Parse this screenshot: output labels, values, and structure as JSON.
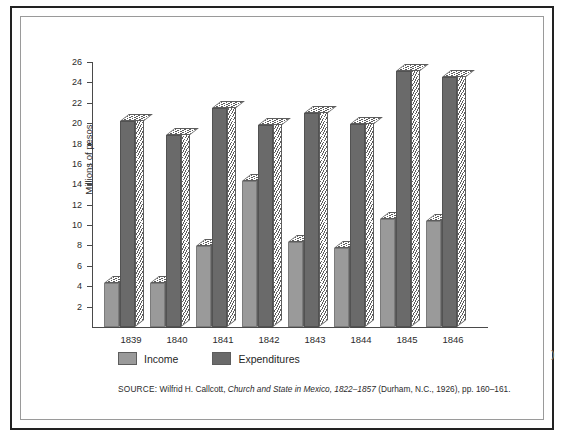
{
  "figure": {
    "y_axis_title": "Millions of pesos",
    "page_artifact": ")"
  },
  "legend": {
    "items": [
      {
        "label": "Income",
        "color": "#9a9a9a"
      },
      {
        "label": "Expenditures",
        "color": "#6a6a6a"
      }
    ]
  },
  "source": {
    "label": "SOURCE:",
    "author": "Wilfrid H. Callcott,",
    "title": "Church and State in Mexico, 1822–1857",
    "publication": "(Durham, N.C., 1926), pp. 160–161."
  },
  "chart_data": {
    "type": "bar",
    "title": "",
    "xlabel": "",
    "ylabel": "Millions of pesos",
    "ylim": [
      0,
      26
    ],
    "ytick_step": 2,
    "yticks": [
      2,
      4,
      6,
      8,
      10,
      12,
      14,
      16,
      18,
      20,
      22,
      24,
      26
    ],
    "grid": false,
    "legend_position": "below-axes",
    "categories": [
      "1839",
      "1840",
      "1841",
      "1842",
      "1843",
      "1844",
      "1845",
      "1846"
    ],
    "series": [
      {
        "name": "Income",
        "color": "#9a9a9a",
        "values": [
          4.3,
          4.3,
          7.9,
          14.3,
          8.3,
          7.8,
          10.6,
          10.4
        ]
      },
      {
        "name": "Expenditures",
        "color": "#6a6a6a",
        "values": [
          20.2,
          18.8,
          21.5,
          19.8,
          21.0,
          19.9,
          25.1,
          24.5
        ]
      }
    ]
  }
}
